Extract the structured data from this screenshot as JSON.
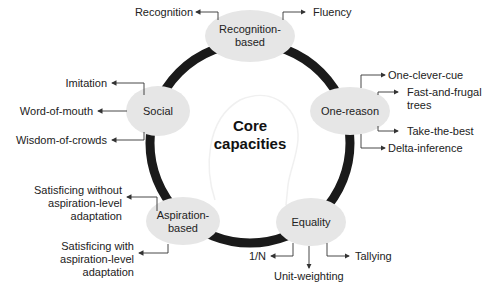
{
  "center": {
    "line1": "Core",
    "line2": "capacities"
  },
  "nodes": {
    "recognition": {
      "line1": "Recognition-",
      "line2": "based"
    },
    "one_reason": {
      "line1": "One-reason"
    },
    "equality": {
      "line1": "Equality"
    },
    "aspiration": {
      "line1": "Aspiration-",
      "line2": "based"
    },
    "social": {
      "line1": "Social"
    }
  },
  "heuristics": {
    "recognition": [
      "Recognition",
      "Fluency"
    ],
    "one_reason": [
      "One-clever-cue",
      "Fast-and-frugal",
      "trees",
      "Take-the-best",
      "Delta-inference"
    ],
    "equality": [
      "1/N",
      "Unit-weighting",
      "Tallying"
    ],
    "aspiration": [
      "Satisficing without",
      "aspiration-level",
      "adaptation",
      "Satisficing with",
      "aspiration-level",
      "adaptation"
    ],
    "social": [
      "Imitation",
      "Word-of-mouth",
      "Wisdom-of-crowds"
    ]
  },
  "colors": {
    "ring": "#1a1a1a",
    "node_fill": "#e6e6e6",
    "arrow": "#333333"
  }
}
